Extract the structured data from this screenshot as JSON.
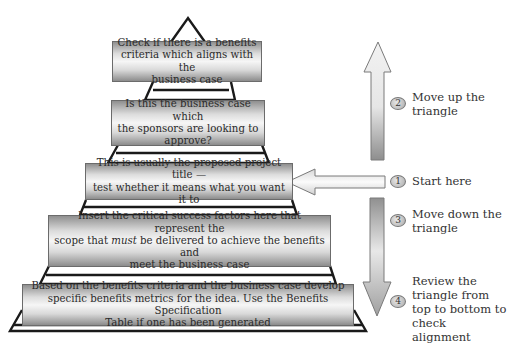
{
  "pyramid": {
    "levels": [
      {
        "id": "benefits-criteria",
        "text": "Check if there is a benefits\ncriteria which aligns with the\nbusiness case"
      },
      {
        "id": "business-case",
        "text": "Is this the business case which\nthe sponsors are looking to\napprove?"
      },
      {
        "id": "project-title",
        "text": "This is usually the proposed project title —\ntest whether it means what you want it to"
      },
      {
        "id": "critical-success-factors",
        "text_pre": "Insert the critical success factors here that represent the\nscope that ",
        "text_em": "must",
        "text_post": " be delivered to achieve the benefits and\nmeet the business case"
      },
      {
        "id": "benefits-metrics",
        "text": "Based on the benefits criteria and the business case develop\nspecific benefits metrics for the idea.  Use the Benefits Specification\nTable if one has been generated"
      }
    ]
  },
  "steps": [
    {
      "number": "1",
      "label": "Start here"
    },
    {
      "number": "2",
      "label": "Move up the\ntriangle"
    },
    {
      "number": "3",
      "label": "Move down the\ntriangle"
    },
    {
      "number": "4",
      "label": "Review the\ntriangle from\ntop to bottom to\ncheck alignment"
    }
  ],
  "arrows": {
    "up": "arrow-up",
    "left": "arrow-left",
    "down": "arrow-down"
  },
  "colors": {
    "outline": "#1a1a1a",
    "box_border": "#6b6b6b",
    "box_mid": "#f6f6f6",
    "box_edge": "#8c8c8c",
    "text": "#2a2a2a"
  }
}
